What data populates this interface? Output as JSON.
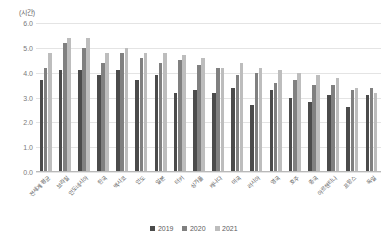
{
  "chart_data": {
    "type": "bar",
    "title": "",
    "subtitle": "",
    "xlabel": "",
    "ylabel": "(시간)",
    "ylim": [
      0.0,
      6.0
    ],
    "ytick_labels": [
      "6.0",
      "5.0",
      "4.0",
      "3.0",
      "2.0",
      "1.0",
      "0.0"
    ],
    "ytick_values": [
      6.0,
      5.0,
      4.0,
      3.0,
      2.0,
      1.0,
      0.0
    ],
    "grid": true,
    "legend_position": "bottom",
    "categories": [
      "전세계 평균",
      "브라질",
      "인도네시아",
      "한국",
      "멕시코",
      "인도",
      "일본",
      "터키",
      "싱가폴",
      "캐나다",
      "미국",
      "러시아",
      "영국",
      "호주",
      "중국",
      "아르헨티나",
      "프랑스",
      "독일"
    ],
    "series": [
      {
        "name": "2019",
        "color": "#4b4b4b",
        "values": [
          3.7,
          4.1,
          4.1,
          3.9,
          4.1,
          3.7,
          3.9,
          3.2,
          3.3,
          3.2,
          3.4,
          2.7,
          3.3,
          3.0,
          2.8,
          3.1,
          2.6,
          3.1
        ]
      },
      {
        "name": "2020",
        "color": "#808080",
        "values": [
          4.2,
          5.2,
          5.0,
          4.4,
          4.8,
          4.6,
          4.4,
          4.5,
          4.3,
          4.2,
          3.9,
          4.0,
          3.6,
          3.7,
          3.5,
          3.5,
          3.3,
          3.4
        ]
      },
      {
        "name": "2021",
        "color": "#bdbdbd",
        "values": [
          4.8,
          5.4,
          5.4,
          4.8,
          5.0,
          4.8,
          4.8,
          4.7,
          4.6,
          4.2,
          4.4,
          4.2,
          4.1,
          4.0,
          3.9,
          3.8,
          3.4,
          3.2
        ]
      }
    ],
    "legend": [
      "2019",
      "2020",
      "2021"
    ]
  }
}
